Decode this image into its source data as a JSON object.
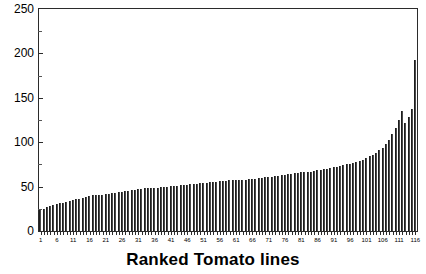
{
  "chart_data": {
    "type": "bar",
    "title": "",
    "xlabel": "Ranked Tomato lines",
    "ylabel": "",
    "ylim": [
      0,
      250
    ],
    "xlim": [
      1,
      116
    ],
    "grid": false,
    "legend": null,
    "y_ticks_major": [
      0,
      50,
      100,
      150,
      200,
      250
    ],
    "y_ticks_minor": [
      25,
      75,
      125,
      175,
      225
    ],
    "x_tick_labels": [
      1,
      6,
      11,
      16,
      21,
      26,
      31,
      36,
      41,
      46,
      51,
      56,
      61,
      66,
      71,
      76,
      81,
      86,
      91,
      96,
      101,
      106,
      111,
      116
    ],
    "bar_color": "#4a4a4a",
    "axis_color": "#2b2b2b",
    "categories": [
      1,
      2,
      3,
      4,
      5,
      6,
      7,
      8,
      9,
      10,
      11,
      12,
      13,
      14,
      15,
      16,
      17,
      18,
      19,
      20,
      21,
      22,
      23,
      24,
      25,
      26,
      27,
      28,
      29,
      30,
      31,
      32,
      33,
      34,
      35,
      36,
      37,
      38,
      39,
      40,
      41,
      42,
      43,
      44,
      45,
      46,
      47,
      48,
      49,
      50,
      51,
      52,
      53,
      54,
      55,
      56,
      57,
      58,
      59,
      60,
      61,
      62,
      63,
      64,
      65,
      66,
      67,
      68,
      69,
      70,
      71,
      72,
      73,
      74,
      75,
      76,
      77,
      78,
      79,
      80,
      81,
      82,
      83,
      84,
      85,
      86,
      87,
      88,
      89,
      90,
      91,
      92,
      93,
      94,
      95,
      96,
      97,
      98,
      99,
      100,
      101,
      102,
      103,
      104,
      105,
      106,
      107,
      108,
      109,
      110,
      111,
      112,
      113,
      114,
      115,
      116
    ],
    "values": [
      24,
      25,
      27,
      28,
      29,
      30,
      31,
      32,
      33,
      34,
      35,
      36,
      36,
      37,
      38,
      39,
      40,
      40,
      41,
      41,
      42,
      42,
      43,
      43,
      44,
      44,
      45,
      45,
      46,
      46,
      47,
      47,
      48,
      48,
      48,
      49,
      49,
      50,
      50,
      50,
      51,
      51,
      51,
      52,
      52,
      52,
      53,
      53,
      53,
      54,
      54,
      54,
      55,
      55,
      55,
      56,
      56,
      56,
      57,
      57,
      57,
      58,
      58,
      58,
      59,
      59,
      59,
      60,
      60,
      61,
      61,
      61,
      62,
      62,
      63,
      63,
      64,
      64,
      65,
      65,
      66,
      66,
      67,
      67,
      68,
      69,
      69,
      70,
      70,
      71,
      72,
      72,
      73,
      74,
      75,
      76,
      77,
      78,
      79,
      80,
      82,
      84,
      86,
      88,
      91,
      94,
      98,
      103,
      109,
      116,
      125,
      135,
      122,
      128,
      137,
      193
    ]
  }
}
